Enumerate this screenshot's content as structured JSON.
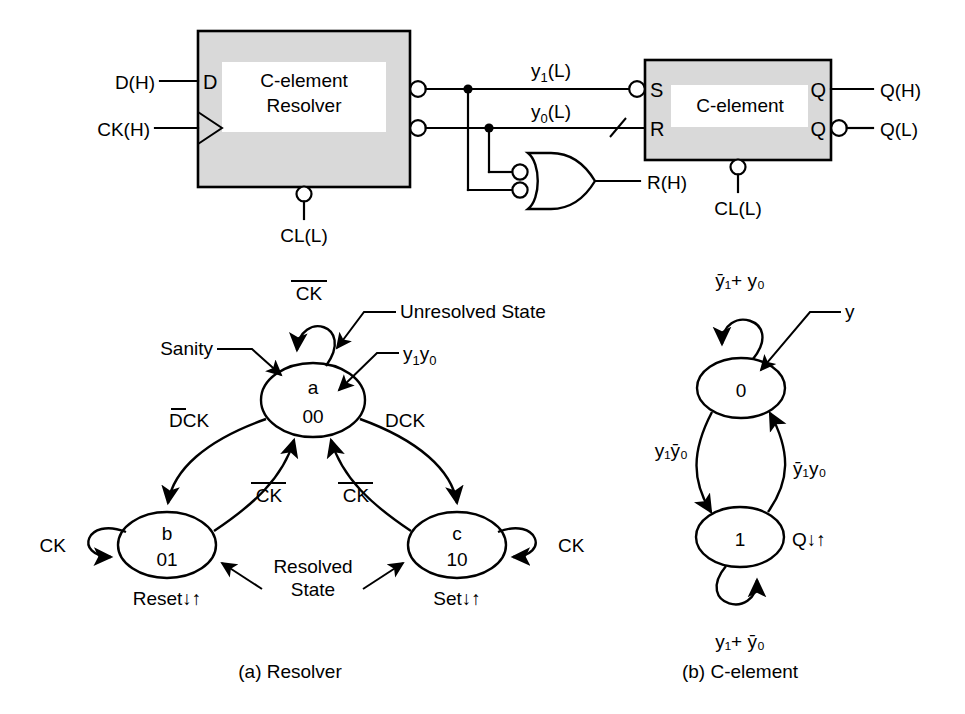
{
  "figure": {
    "caption_a": "(a) Resolver",
    "caption_b": "(b) C-element"
  },
  "circuit": {
    "resolver_block": {
      "label_line1": "C-element",
      "label_line2": "Resolver",
      "pin_d": "D",
      "input_d_label": "D(H)",
      "input_ck_label": "CK(H)",
      "clear_label": "CL(L)"
    },
    "celement_block": {
      "label": "C-element",
      "pin_s": "S",
      "pin_r": "R",
      "pin_q_top": "Q",
      "pin_q_bottom": "Q",
      "out_q_h": "Q(H)",
      "out_q_l": "Q(L)",
      "clear_label": "CL(L)"
    },
    "wires": {
      "y1_label_base": "y",
      "y1_label_sub": "1",
      "y1_label_suffix": "(L)",
      "y0_label_base": "y",
      "y0_label_sub": "0",
      "y0_label_suffix": "(L)"
    },
    "nor_gate": {
      "output_label": "R(H)"
    }
  },
  "resolver_fsm": {
    "states": [
      {
        "id": "a",
        "name": "a",
        "code": "00",
        "note": ""
      },
      {
        "id": "b",
        "name": "b",
        "code": "01",
        "note": "Reset↓↑"
      },
      {
        "id": "c",
        "name": "c",
        "code": "10",
        "note": "Set↓↑"
      }
    ],
    "transitions": {
      "a_self": "CK",
      "a_self_overbar": true,
      "a_to_b": "DCK",
      "a_to_b_overbar_on": "D",
      "a_to_c": "DCK",
      "b_self": "CK",
      "c_self": "CK",
      "b_to_a": "CK",
      "b_to_a_overbar": true,
      "c_to_a": "CK",
      "c_to_a_overbar": true
    },
    "annotations": {
      "sanity": "Sanity",
      "unresolved": "Unresolved State",
      "outputs": "y₁y₀",
      "outputs_base": "y",
      "outputs_sub1": "1",
      "outputs_sub2": "0",
      "resolved_line1": "Resolved",
      "resolved_line2": "State"
    }
  },
  "celement_fsm": {
    "states": [
      {
        "id": "0",
        "name": "0",
        "note": ""
      },
      {
        "id": "1",
        "name": "1",
        "note": "Q↓↑"
      }
    ],
    "transitions": {
      "s0_self": "ȳ₁+ y₀",
      "s1_self": "y₁+ ȳ₀",
      "s0_to_s1": "y₁ȳ₀",
      "s1_to_s0": "ȳ₁y₀"
    },
    "annotations": {
      "output_pointer": "y"
    }
  },
  "colors": {
    "block_fill": "#d9d9d9",
    "line": "#000000",
    "background": "#ffffff"
  }
}
